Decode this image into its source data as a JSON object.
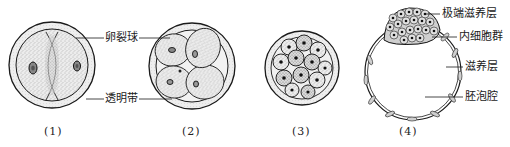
{
  "figure": {
    "title": "",
    "panels": [
      {
        "id": "1",
        "caption": "(1)",
        "stage": "2-cell"
      },
      {
        "id": "2",
        "caption": "(2)",
        "stage": "4-cell"
      },
      {
        "id": "3",
        "caption": "(3)",
        "stage": "morula"
      },
      {
        "id": "4",
        "caption": "(4)",
        "stage": "blastocyst"
      }
    ],
    "labels": {
      "blastomere": "卵裂球",
      "zona_pellucida": "透明带",
      "polar_trophoblast": "极端滋养层",
      "inner_cell_mass": "内细胞群",
      "trophoblast": "滋养层",
      "blastocoel": "胚泡腔"
    },
    "colors": {
      "line": "#1a1a1a",
      "stipple_fill": "#d9d9d9",
      "zona_fill": "#e6e6e6",
      "background": "#ffffff"
    }
  }
}
